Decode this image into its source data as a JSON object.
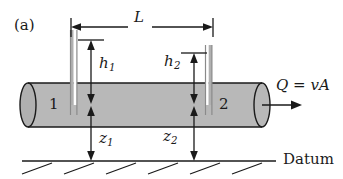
{
  "figure": {
    "panel_label": "(a)",
    "caption_labels": {
      "length": "L",
      "head_1": "h",
      "head_1_sub": "1",
      "head_2": "h",
      "head_2_sub": "2",
      "elevation_1": "z",
      "elevation_1_sub": "1",
      "elevation_2": "z",
      "elevation_2_sub": "2",
      "station_1": "1",
      "station_2": "2",
      "flow_equation": "Q = vA",
      "datum": "Datum"
    },
    "colors": {
      "pipe_fill": "#b8b8b8",
      "pipe_outline": "#1a1a1a",
      "fluid_fill": "#b0b0b0",
      "tube_outline": "#8a8a8a",
      "line": "#1a1a1a",
      "text": "#1a1a1a",
      "background": "#ffffff"
    },
    "geometry": {
      "pipe_left_x": 28,
      "pipe_right_x": 262,
      "pipe_top_y": 83,
      "pipe_bottom_y": 127,
      "ellipse_rx": 8,
      "ellipse_ry": 22,
      "datum_y": 161,
      "datum_left_x": 22,
      "datum_right_x": 276,
      "dimension_L_y": 27,
      "dimension_L_left_x": 71,
      "dimension_L_right_x": 213,
      "tube1_x": 73,
      "tube1_top_y": 30,
      "tube2_x": 208,
      "tube2_top_y": 45,
      "h1_arrow_x": 91,
      "h1_top_y": 40,
      "h2_arrow_x": 194,
      "h2_top_y": 53,
      "piezometric_y": 104,
      "hatch_count": 6,
      "hatch_spacing": 42,
      "hatch_start_x": 22,
      "hatch_length": 34
    }
  }
}
